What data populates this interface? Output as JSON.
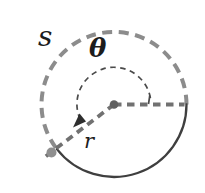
{
  "figure": {
    "labels": {
      "arc_length": "s",
      "angle": "θ",
      "radius": "r"
    },
    "colors": {
      "background": "#ffffff",
      "dashed_arc": "#8c8c8c",
      "solid_arc": "#3f3f3f",
      "radius_line": "#717171",
      "angle_arc": "#4a4a4a",
      "arrowhead": "#2e2e2e",
      "center_dot": "#606060",
      "endpoint_dot": "#8f8f8f",
      "label_text": "#1c1c1c"
    }
  }
}
